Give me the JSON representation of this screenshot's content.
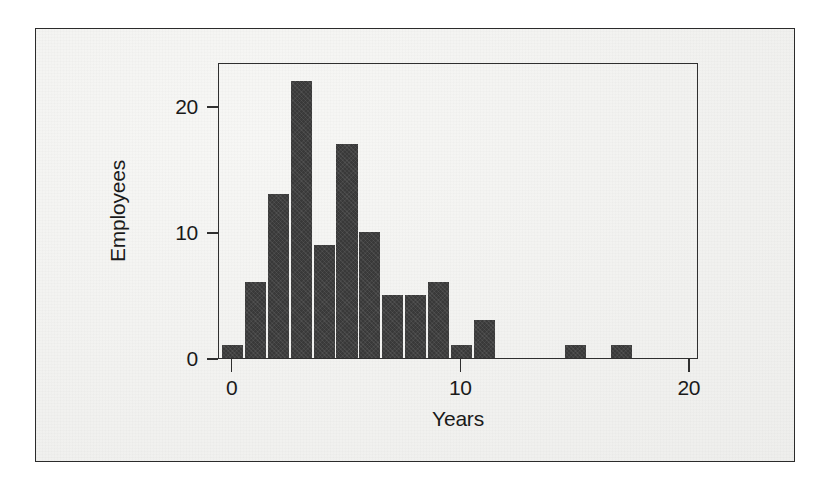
{
  "chart_data": {
    "type": "bar",
    "chart_subtype": "histogram",
    "title": "",
    "xlabel": "Years",
    "ylabel": "Employees",
    "categories": [
      0,
      1,
      2,
      3,
      4,
      5,
      6,
      7,
      8,
      9,
      10,
      11,
      12,
      13,
      14,
      15,
      16,
      17
    ],
    "values": [
      1,
      6,
      13,
      22,
      9,
      17,
      10,
      5,
      5,
      6,
      1,
      3,
      0,
      0,
      0,
      1,
      0,
      1
    ],
    "bin_width": 1,
    "xlim": [
      -0.6,
      20.4
    ],
    "ylim": [
      0,
      23.5
    ],
    "xticks": [
      0,
      10,
      20
    ],
    "xtick_labels": [
      "0",
      "10",
      "20"
    ],
    "yticks": [
      0,
      10,
      20
    ],
    "ytick_labels": [
      "0",
      "10",
      "20"
    ],
    "grid": false,
    "legend": false,
    "bar_color": "#393939",
    "axis_color": "#2f2f2f",
    "text_color": "#1a1a1a",
    "background_color": "#f2f2f0",
    "frame_border_color": "#2b2b2b"
  }
}
